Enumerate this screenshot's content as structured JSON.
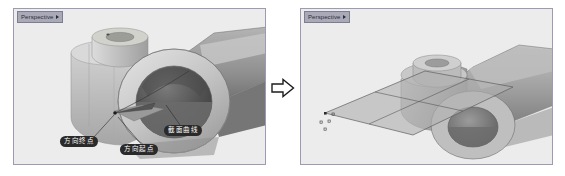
{
  "app": {
    "accent_dark": "#2a2a2a",
    "viewport_bg": "#eceded",
    "viewport_border": "#9b9bb4",
    "title_tab_bg": "#a9a9b8",
    "model_light": "#c9c9c9",
    "model_mid": "#a8a8a8",
    "model_dark": "#6f6f6f",
    "surface_fill": "#b8b8b8"
  },
  "viewports": [
    {
      "id": "left",
      "title": "Perspective",
      "menu_icon": "chevron-down-icon",
      "callouts": [
        {
          "id": "dir-end",
          "label": "方向终点"
        },
        {
          "id": "dir-start",
          "label": "方向起点"
        },
        {
          "id": "section",
          "label": "截面曲线"
        }
      ]
    },
    {
      "id": "right",
      "title": "Perspective",
      "menu_icon": "chevron-down-icon",
      "callouts": []
    }
  ],
  "transition": {
    "icon": "right-arrow-icon",
    "label": ""
  }
}
